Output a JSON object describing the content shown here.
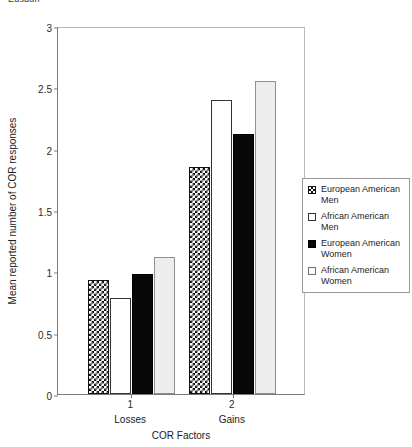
{
  "top_caption": "Edsdgn",
  "chart_data": {
    "type": "bar",
    "title": "",
    "xlabel": "COR Factors",
    "ylabel": "Mean reported number of COR responses",
    "categories": [
      "Losses",
      "Gains"
    ],
    "category_ticks": [
      "1",
      "2"
    ],
    "ylim": [
      0,
      3
    ],
    "yticks": [
      "0",
      "0.5",
      "1",
      "1.5",
      "2",
      "2.5",
      "3"
    ],
    "ytick_values": [
      0,
      0.5,
      1,
      1.5,
      2,
      2.5,
      3
    ],
    "grid": false,
    "legend_position": "right",
    "series": [
      {
        "name": "European American Men",
        "fill": "checkerboard",
        "values": [
          0.93,
          1.85
        ]
      },
      {
        "name": "African American Men",
        "fill": "open-white",
        "values": [
          0.78,
          2.4
        ]
      },
      {
        "name": "European American Women",
        "fill": "solid-black",
        "values": [
          0.98,
          2.12
        ]
      },
      {
        "name": "African American Women",
        "fill": "light-grey",
        "values": [
          1.12,
          2.55
        ]
      }
    ]
  },
  "legend": {
    "items": [
      {
        "label": "European American Men"
      },
      {
        "label": "African American Men"
      },
      {
        "label": "European American Women"
      },
      {
        "label": "African American Women"
      }
    ]
  }
}
